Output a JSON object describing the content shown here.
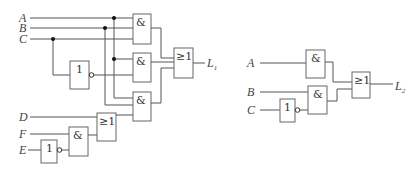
{
  "diagram": {
    "type": "logic-circuit",
    "left_circuit": {
      "inputs": {
        "a": "A",
        "b": "B",
        "c": "C",
        "d": "D",
        "f": "F",
        "e": "E"
      },
      "gate_symbols": {
        "and": "&",
        "or": "≥1",
        "not": "1"
      },
      "output": {
        "main": "L",
        "sub": "1"
      }
    },
    "right_circuit": {
      "inputs": {
        "a": "A",
        "b": "B",
        "c": "C"
      },
      "gate_symbols": {
        "and": "&",
        "or": "≥1",
        "not": "1"
      },
      "output": {
        "main": "L",
        "sub": "2"
      }
    },
    "colors": {
      "wire": "#555555",
      "gate_border": "#666666",
      "junction": "#111111"
    }
  }
}
